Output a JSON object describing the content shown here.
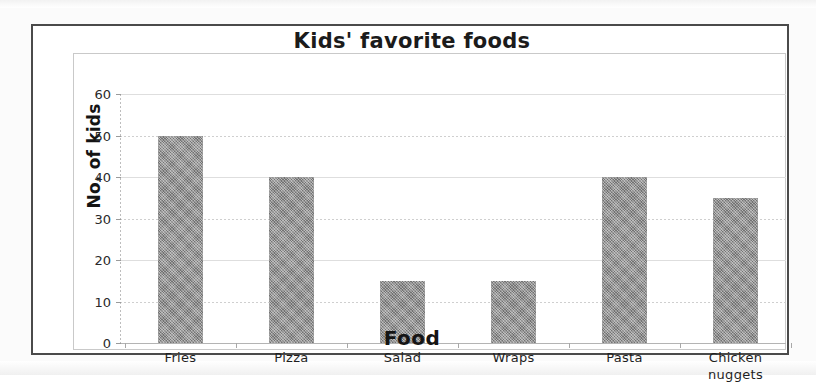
{
  "chart_data": {
    "type": "bar",
    "title": "Kids' favorite foods",
    "xlabel": "Food",
    "ylabel": "No. of kids",
    "categories": [
      "Fries",
      "Pizza",
      "Salad",
      "Wraps",
      "Pasta",
      "Chicken nuggets"
    ],
    "category_lines": [
      [
        "Fries"
      ],
      [
        "Pizza"
      ],
      [
        "Salad"
      ],
      [
        "Wraps"
      ],
      [
        "Pasta"
      ],
      [
        "Chicken",
        "nuggets"
      ]
    ],
    "values": [
      50,
      40,
      15,
      15,
      40,
      35
    ],
    "ylim": [
      0,
      60
    ],
    "ytick_labels": [
      "0",
      "10",
      "20",
      "30",
      "40",
      "50",
      "60"
    ],
    "ytick_values": [
      0,
      10,
      20,
      30,
      40,
      50,
      60
    ],
    "ytick_step": 10,
    "grid": true,
    "grid_axis": "y",
    "legend": null,
    "legend_position": "none",
    "bar_color": "#8a8a8a",
    "gridline_color": "#dedede",
    "frame_color": "#4a4a4a",
    "plot_border_color": "#c9c9c9",
    "background_color": "#ffffff"
  }
}
